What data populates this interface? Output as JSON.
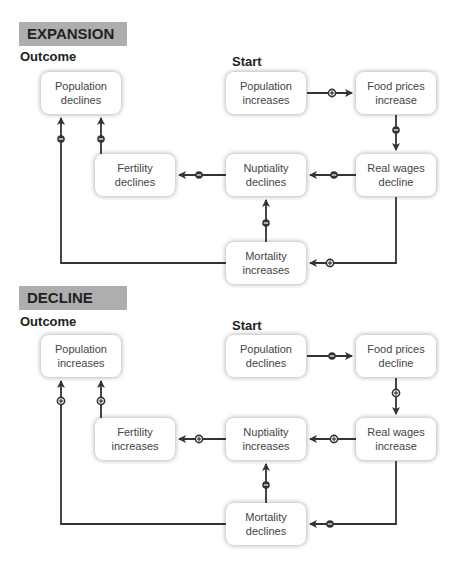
{
  "sections": [
    {
      "title": "EXPANSION",
      "outcome_label": "Outcome",
      "start_label": "Start",
      "nodes": {
        "population_outcome": [
          "Population",
          "declines"
        ],
        "population_start": [
          "Population",
          "increases"
        ],
        "food_prices": [
          "Food prices",
          "increase"
        ],
        "real_wages": [
          "Real wages",
          "decline"
        ],
        "nuptiality": [
          "Nuptiality",
          "declines"
        ],
        "fertility": [
          "Fertility",
          "declines"
        ],
        "mortality": [
          "Mortality",
          "increases"
        ]
      },
      "edges": [
        {
          "from": "Population increases",
          "to": "Food prices increase",
          "sign": "+"
        },
        {
          "from": "Food prices increase",
          "to": "Real wages decline",
          "sign": "-"
        },
        {
          "from": "Real wages decline",
          "to": "Nuptiality declines",
          "sign": "-"
        },
        {
          "from": "Nuptiality declines",
          "to": "Fertility declines",
          "sign": "-"
        },
        {
          "from": "Fertility declines",
          "to": "Population declines",
          "sign": "-"
        },
        {
          "from": "Real wages decline",
          "to": "Mortality increases",
          "sign": "+"
        },
        {
          "from": "Mortality increases",
          "to": "Nuptiality declines",
          "sign": "-"
        },
        {
          "from": "Mortality increases",
          "to": "Population declines",
          "sign": "-"
        }
      ]
    },
    {
      "title": "DECLINE",
      "outcome_label": "Outcome",
      "start_label": "Start",
      "nodes": {
        "population_outcome": [
          "Population",
          "increases"
        ],
        "population_start": [
          "Population",
          "declines"
        ],
        "food_prices": [
          "Food prices",
          "decline"
        ],
        "real_wages": [
          "Real wages",
          "increase"
        ],
        "nuptiality": [
          "Nuptiality",
          "increases"
        ],
        "fertility": [
          "Fertility",
          "increases"
        ],
        "mortality": [
          "Mortality",
          "declines"
        ]
      },
      "edges": [
        {
          "from": "Population declines",
          "to": "Food prices decline",
          "sign": "-"
        },
        {
          "from": "Food prices decline",
          "to": "Real wages increase",
          "sign": "+"
        },
        {
          "from": "Real wages increase",
          "to": "Nuptiality increases",
          "sign": "+"
        },
        {
          "from": "Nuptiality increases",
          "to": "Fertility increases",
          "sign": "+"
        },
        {
          "from": "Fertility increases",
          "to": "Population increases",
          "sign": "+"
        },
        {
          "from": "Real wages increase",
          "to": "Mortality declines",
          "sign": "-"
        },
        {
          "from": "Mortality declines",
          "to": "Nuptiality increases",
          "sign": "-"
        },
        {
          "from": "Mortality declines",
          "to": "Population increases",
          "sign": "+"
        }
      ]
    }
  ],
  "colors": {
    "banner": "#aeaeae",
    "line": "#333333",
    "box_bg": "#ffffff"
  }
}
